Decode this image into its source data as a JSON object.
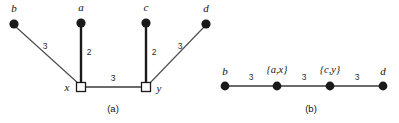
{
  "figure": {
    "panels": [
      {
        "id": "a",
        "caption": "(a)",
        "nodes": [
          {
            "id": "b",
            "label": "b",
            "shape": "dot",
            "x": 14,
            "y": 24
          },
          {
            "id": "a",
            "label": "a",
            "shape": "dot",
            "x": 81,
            "y": 23
          },
          {
            "id": "c",
            "label": "c",
            "shape": "dot",
            "x": 146,
            "y": 23
          },
          {
            "id": "d",
            "label": "d",
            "shape": "dot",
            "x": 206,
            "y": 24
          },
          {
            "id": "x",
            "label": "x",
            "shape": "square",
            "x": 81,
            "y": 86
          },
          {
            "id": "y",
            "label": "y",
            "shape": "square",
            "x": 146,
            "y": 86
          }
        ],
        "edges": [
          {
            "from": "b",
            "to": "x",
            "weight": "3",
            "style": "thin",
            "label_x": 45,
            "label_y": 49
          },
          {
            "from": "a",
            "to": "x",
            "weight": "2",
            "style": "thick",
            "label_x": 88,
            "label_y": 55
          },
          {
            "from": "c",
            "to": "y",
            "weight": "2",
            "style": "thick",
            "label_x": 153,
            "label_y": 55
          },
          {
            "from": "d",
            "to": "y",
            "weight": "3",
            "style": "thin",
            "label_x": 180,
            "label_y": 49
          },
          {
            "from": "x",
            "to": "y",
            "weight": "3",
            "style": "med",
            "label_x": 113,
            "label_y": 80
          }
        ]
      },
      {
        "id": "b",
        "caption": "(b)",
        "nodes": [
          {
            "id": "b",
            "label": "b",
            "shape": "dot",
            "x": 225,
            "y": 86
          },
          {
            "id": "ax",
            "label": "{a,x}",
            "shape": "dot",
            "x": 277,
            "y": 86
          },
          {
            "id": "cy",
            "label": "{c,y}",
            "shape": "dot",
            "x": 330,
            "y": 86
          },
          {
            "id": "d",
            "label": "d",
            "shape": "dot",
            "x": 383,
            "y": 86
          }
        ],
        "edges": [
          {
            "from": "b",
            "to": "ax",
            "weight": "3",
            "style": "med",
            "label_x": 251,
            "label_y": 79
          },
          {
            "from": "ax",
            "to": "cy",
            "weight": "3",
            "style": "med",
            "label_x": 304,
            "label_y": 79
          },
          {
            "from": "cy",
            "to": "d",
            "weight": "3",
            "style": "med",
            "label_x": 357,
            "label_y": 79
          }
        ]
      }
    ],
    "colors": {
      "node_fill": "#1a1a1a",
      "square_fill": "#ffffff",
      "edge_thin": "#4a4a4a",
      "edge_thick": "#1a1a1a",
      "background": "#ffffff"
    }
  }
}
